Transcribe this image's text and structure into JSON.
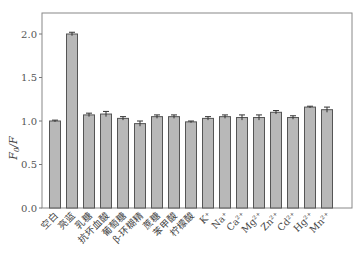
{
  "chart_data": {
    "type": "bar",
    "title": "",
    "xlabel": "",
    "ylabel": "F0/F",
    "ylim": [
      0,
      2.25
    ],
    "yticks": [
      0.0,
      0.5,
      1.0,
      1.5,
      2.0
    ],
    "ytick_labels": [
      "0.0",
      "0.5",
      "1.0",
      "1.5",
      "2.0"
    ],
    "grid": false,
    "legend": null,
    "categories": [
      "空白",
      "亮蓝",
      "乳糖",
      "抗坏血酸",
      "葡萄糖",
      "β-环糊精",
      "蔗糖",
      "苯甲酸",
      "柠檬酸",
      "K⁺",
      "Na⁺",
      "Ca²⁺",
      "Mg²⁺",
      "Zn²⁺",
      "Cd²⁺",
      "Hg²⁺",
      "Mn²⁺"
    ],
    "values": [
      1.0,
      2.0,
      1.07,
      1.08,
      1.03,
      0.97,
      1.05,
      1.05,
      0.99,
      1.03,
      1.05,
      1.04,
      1.04,
      1.1,
      1.04,
      1.16,
      1.13
    ],
    "errors": [
      0.01,
      0.02,
      0.02,
      0.03,
      0.02,
      0.03,
      0.02,
      0.02,
      0.01,
      0.02,
      0.02,
      0.03,
      0.03,
      0.02,
      0.02,
      0.01,
      0.03
    ],
    "bar_color": "#b8b8b8",
    "edge_color": "#555555"
  }
}
